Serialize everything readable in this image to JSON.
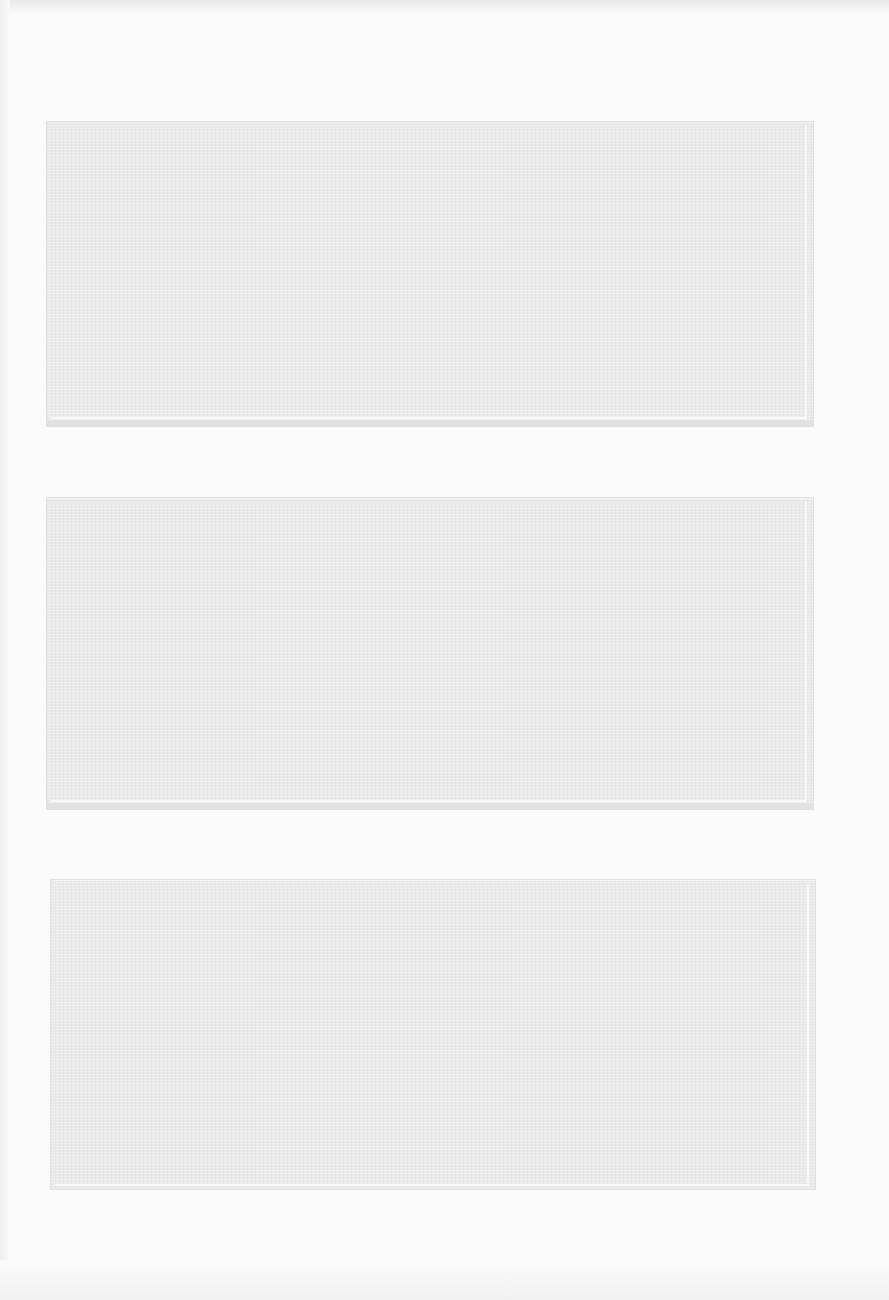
{
  "page": {
    "background_color": "#fbfbfb",
    "boxes": [
      {
        "id": "box-1",
        "label": "",
        "fill_color": "#e9e9e9"
      },
      {
        "id": "box-2",
        "label": "",
        "fill_color": "#e9e9e9"
      },
      {
        "id": "box-3",
        "label": "",
        "fill_color": "#e9e9e9"
      }
    ]
  }
}
